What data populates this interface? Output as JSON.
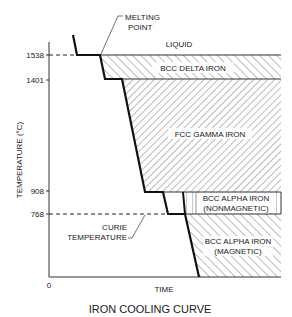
{
  "title": "IRON COOLING CURVE",
  "axes": {
    "ylabel": "TEMPERATURE (°C)",
    "xlabel": "TIME",
    "origin": "0",
    "yticks": [
      "1538",
      "1401",
      "908",
      "768"
    ]
  },
  "regions": {
    "liquid": "LIQUID",
    "delta": "BCC DELTA IRON",
    "gamma": "FCC GAMMA IRON",
    "alpha_nonmag_1": "BCC ALPHA IRON",
    "alpha_nonmag_2": "(NONMAGNETIC)",
    "alpha_mag_1": "BCC ALPHA IRON",
    "alpha_mag_2": "(MAGNETIC)"
  },
  "annotations": {
    "melting_1": "MELTING",
    "melting_2": "POINT",
    "curie_1": "CURIE",
    "curie_2": "TEMPERATURE"
  },
  "colors": {
    "line": "#1a1a1a",
    "hatch": "#555555",
    "background": "#ffffff"
  }
}
